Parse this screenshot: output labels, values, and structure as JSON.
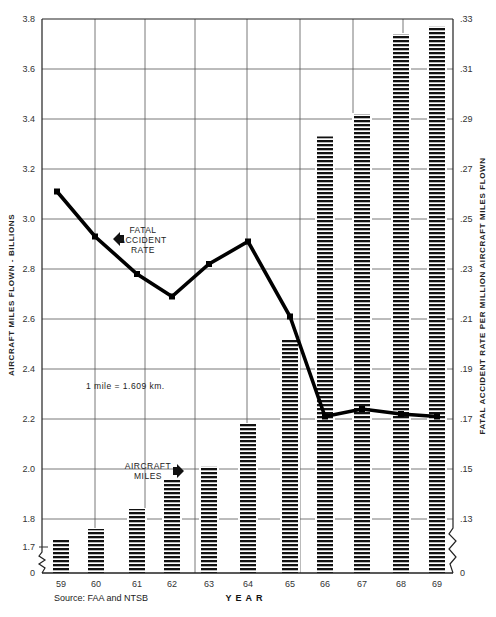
{
  "chart_data": {
    "type": "bar+line",
    "title": "",
    "xlabel": "YEAR",
    "ylabel": "AIRCRAFT MILES FLOWN - BILLIONS",
    "y2label": "FATAL ACCIDENT RATE PER MILLION AIRCRAFT MILES FLOWN",
    "categories": [
      "59",
      "60",
      "61",
      "62",
      "63",
      "64",
      "65",
      "66",
      "67",
      "68",
      "69"
    ],
    "series": [
      {
        "name": "AIRCRAFT MILES",
        "type": "bar",
        "axis": "left",
        "values": [
          1.72,
          1.76,
          1.84,
          1.96,
          2.01,
          2.18,
          2.52,
          3.33,
          3.42,
          3.74,
          3.77
        ]
      },
      {
        "name": "FATAL ACCIDENT RATE",
        "type": "line",
        "axis": "right",
        "values": [
          0.261,
          0.243,
          0.228,
          0.219,
          0.232,
          0.241,
          0.211,
          0.171,
          0.174,
          0.172,
          0.171
        ]
      }
    ],
    "y_ticks": [
      "0",
      "1.7",
      "1.8",
      "2.0",
      "2.2",
      "2.4",
      "2.6",
      "2.8",
      "3.0",
      "3.2",
      "3.4",
      "3.6",
      "3.8"
    ],
    "y2_ticks": [
      "0",
      ".13",
      ".15",
      ".17",
      ".19",
      ".21",
      ".23",
      ".25",
      ".27",
      ".29",
      ".31",
      ".33"
    ],
    "ylim": [
      1.7,
      3.8
    ],
    "y2lim": [
      0.12,
      0.33
    ],
    "axis_break": true,
    "grid": true,
    "annotations": {
      "fatal_label": [
        "FATAL",
        "ACCIDENT",
        "RATE"
      ],
      "miles_label": [
        "AIRCRAFT",
        "MILES"
      ],
      "conversion": "1 mile = 1.609 km.",
      "source": "Source:  FAA and NTSB"
    },
    "colors": {
      "ink": "#111111",
      "grid": "#555555",
      "background": "#ffffff"
    }
  }
}
